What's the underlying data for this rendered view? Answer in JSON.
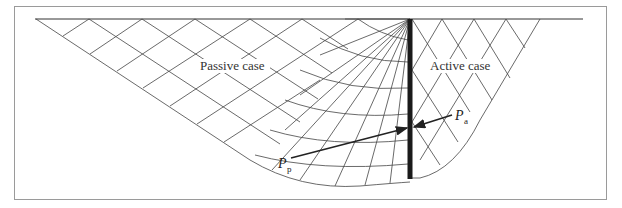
{
  "figure": {
    "labels": {
      "passive": "Passive case",
      "active": "Active case"
    },
    "forces": {
      "passive": {
        "symbol": "P",
        "subscript": "p"
      },
      "active": {
        "symbol": "P",
        "subscript": "a"
      }
    },
    "colors": {
      "line": "#333333",
      "wall": "#1a1a1a",
      "frame": "#9a9a9a"
    }
  }
}
